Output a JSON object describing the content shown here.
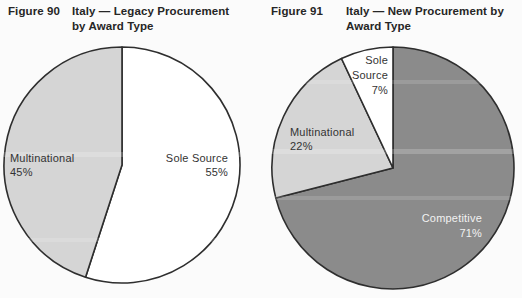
{
  "page": {
    "background_color": "#fbfbfb",
    "text_color": "#2b2b2b"
  },
  "figures": [
    {
      "figure_label": "Figure 90",
      "title_line1": "Italy — Legacy Procurement",
      "title_line2": "by Award Type",
      "labels": {
        "sole_source": {
          "lines": [
            "Sole Source",
            "55%"
          ]
        },
        "multinational": {
          "lines": [
            "Multinational",
            "45%"
          ]
        }
      }
    },
    {
      "figure_label": "Figure 91",
      "title_line1": "Italy — New Procurement by",
      "title_line2": "Award Type",
      "labels": {
        "sole_source": {
          "lines": [
            "Sole",
            "Source",
            "7%"
          ]
        },
        "multinational": {
          "lines": [
            "Multinational",
            "22%"
          ]
        },
        "competitive": {
          "lines": [
            "Competitive",
            "71%"
          ]
        }
      }
    }
  ],
  "chart_data": [
    {
      "type": "pie",
      "figure_label": "Figure 90",
      "title": "Italy — Legacy Procurement by Award Type",
      "categories": [
        "Sole Source",
        "Multinational"
      ],
      "values": [
        55,
        45
      ],
      "unit": "percent",
      "slice_colors": [
        "#ffffff",
        "#d5d5d5"
      ],
      "outline_color": "#2e2e2e",
      "start_angle_deg": 0,
      "direction": "clockwise",
      "legend": "none",
      "label_style": "inside-slice"
    },
    {
      "type": "pie",
      "figure_label": "Figure 91",
      "title": "Italy — New Procurement by Award Type",
      "categories": [
        "Competitive",
        "Multinational",
        "Sole Source"
      ],
      "values": [
        71,
        22,
        7
      ],
      "unit": "percent",
      "slice_colors": [
        "#8b8b8b",
        "#d5d5d5",
        "#ffffff"
      ],
      "outline_color": "#2e2e2e",
      "start_angle_deg": 0,
      "direction": "clockwise",
      "legend": "none",
      "label_style": "inside-slice"
    }
  ]
}
